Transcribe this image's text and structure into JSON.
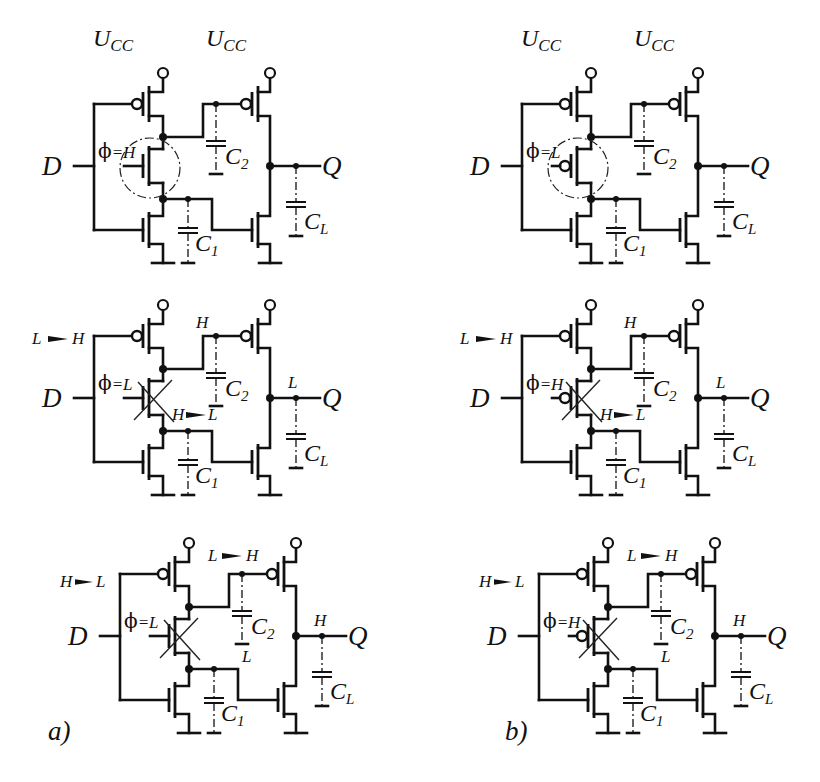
{
  "figure": {
    "columns": [
      {
        "id": "a",
        "caption": "a)",
        "switch_type": "nmos"
      },
      {
        "id": "b",
        "caption": "b)",
        "switch_type": "pmos"
      }
    ],
    "labels": {
      "supply": "U",
      "supply_sub": "CC",
      "input": "D",
      "output": "Q",
      "c1": "C",
      "c1_sub": "1",
      "c2": "C",
      "c2_sub": "2",
      "cl": "C",
      "cl_sub": "L",
      "phi": "ϕ"
    },
    "panels": [
      {
        "id": "a1",
        "column": "a",
        "row": 1,
        "phi": "=H",
        "switch_on": true,
        "show_supply_label": true,
        "d_transition": "",
        "node2_label": "",
        "node1_label": "",
        "q_label": ""
      },
      {
        "id": "b1",
        "column": "b",
        "row": 1,
        "phi": "=L",
        "switch_on": true,
        "show_supply_label": true,
        "d_transition": "",
        "node2_label": "",
        "node1_label": "",
        "q_label": ""
      },
      {
        "id": "a2",
        "column": "a",
        "row": 2,
        "phi": "=L",
        "switch_on": false,
        "show_supply_label": false,
        "d_transition": "L ▸H",
        "node2_label": "H",
        "node1_label": "H ▸L",
        "q_label": "L"
      },
      {
        "id": "b2",
        "column": "b",
        "row": 2,
        "phi": "=H",
        "switch_on": false,
        "show_supply_label": false,
        "d_transition": "L ▸H",
        "node2_label": "H",
        "node1_label": "H ▸L",
        "q_label": "L"
      },
      {
        "id": "a3",
        "column": "a",
        "row": 3,
        "phi": "=L",
        "switch_on": false,
        "show_supply_label": false,
        "d_transition": "H ▸L",
        "node2_label": "L ▸H",
        "node1_label": "L",
        "q_label": "H"
      },
      {
        "id": "b3",
        "column": "b",
        "row": 3,
        "phi": "=H",
        "switch_on": false,
        "show_supply_label": false,
        "d_transition": "H ▸L",
        "node2_label": "L ▸H",
        "node1_label": "L",
        "q_label": "H"
      }
    ],
    "transitions": {
      "a2": {
        "d_from": "L",
        "d_to": "H",
        "n2": "H",
        "n1_from": "H",
        "n1_to": "L",
        "q": "L"
      },
      "b2": {
        "d_from": "L",
        "d_to": "H",
        "n2": "H",
        "n1_from": "H",
        "n1_to": "L",
        "q": "L"
      },
      "a3": {
        "d_from": "H",
        "d_to": "L",
        "n2_from": "L",
        "n2_to": "H",
        "n1": "L",
        "q": "H"
      },
      "b3": {
        "d_from": "H",
        "d_to": "L",
        "n2_from": "L",
        "n2_to": "H",
        "n1": "L",
        "q": "H"
      }
    }
  }
}
